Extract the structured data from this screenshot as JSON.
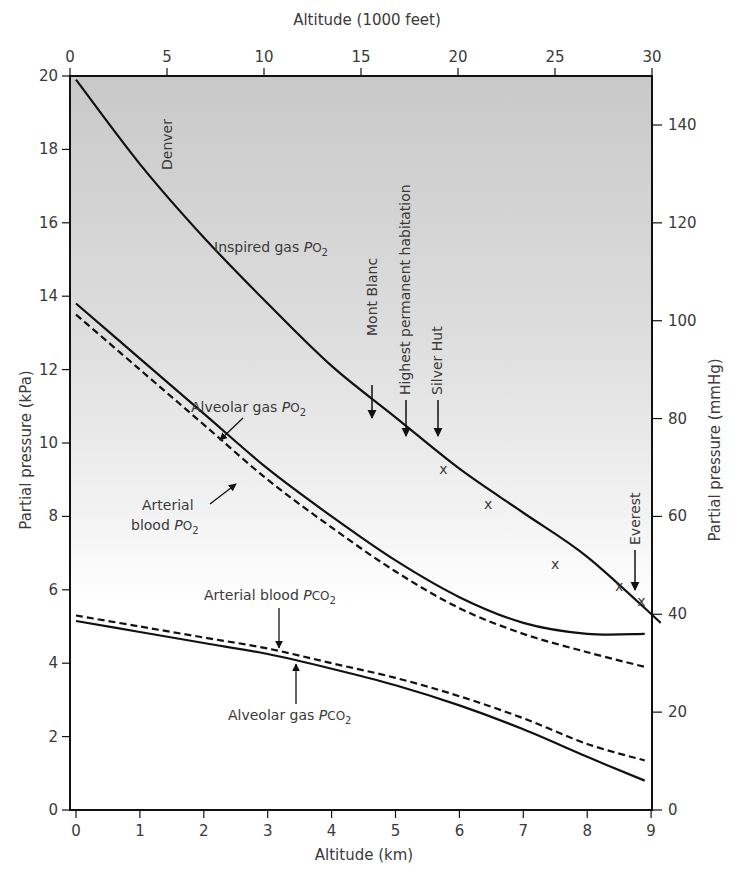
{
  "chart_data": {
    "type": "line",
    "title": "",
    "xlabel": "Altitude (km)",
    "x2label": "Altitude (1000 feet)",
    "ylabel": "Partial pressure (kPa)",
    "y2label": "Partial pressure (mmHg)",
    "xlim": [
      0,
      9.15
    ],
    "ylim": [
      0,
      20
    ],
    "x_ticks": [
      "0",
      "1",
      "2",
      "3",
      "4",
      "5",
      "6",
      "7",
      "8",
      "9"
    ],
    "x2_ticks": [
      "0",
      "5",
      "10",
      "15",
      "20",
      "25",
      "30"
    ],
    "y_ticks": [
      "0",
      "2",
      "4",
      "6",
      "8",
      "10",
      "12",
      "14",
      "16",
      "18",
      "20"
    ],
    "y2_ticks": [
      "0",
      "20",
      "40",
      "60",
      "80",
      "100",
      "120",
      "140"
    ],
    "grid": false,
    "background": "gray gradient (dark at top, fading to white near 5 kPa)",
    "series": [
      {
        "name": "Inspired gas PO2",
        "style": "solid",
        "x": [
          0,
          1,
          2,
          3,
          4,
          5,
          6,
          7,
          8,
          9.15
        ],
        "y": [
          19.9,
          17.6,
          15.6,
          13.8,
          12.1,
          10.7,
          9.3,
          8.1,
          6.9,
          5.1
        ]
      },
      {
        "name": "Alveolar gas PO2",
        "style": "solid",
        "x": [
          0,
          1,
          2,
          3,
          4,
          5,
          6,
          7,
          8,
          8.9
        ],
        "y": [
          13.8,
          12.3,
          10.8,
          9.3,
          8.0,
          6.8,
          5.8,
          5.1,
          4.8,
          4.8
        ]
      },
      {
        "name": "Arterial blood PO2",
        "style": "dashed",
        "x": [
          0,
          1,
          2,
          3,
          4,
          5,
          6,
          7,
          8,
          8.9
        ],
        "y": [
          13.5,
          12.0,
          10.5,
          9.0,
          7.7,
          6.5,
          5.5,
          4.8,
          4.3,
          3.9
        ]
      },
      {
        "name": "Arterial blood PCO2",
        "style": "dashed",
        "x": [
          0,
          1,
          2,
          3,
          4,
          5,
          6,
          7,
          8,
          8.9
        ],
        "y": [
          5.3,
          5.0,
          4.7,
          4.4,
          4.0,
          3.6,
          3.1,
          2.5,
          1.8,
          1.35
        ]
      },
      {
        "name": "Alveolar gas PCO2",
        "style": "solid",
        "x": [
          0,
          1,
          2,
          3,
          4,
          5,
          6,
          7,
          8,
          8.9
        ],
        "y": [
          5.15,
          4.85,
          4.55,
          4.25,
          3.85,
          3.4,
          2.85,
          2.2,
          1.45,
          0.8
        ]
      }
    ],
    "markers": [
      {
        "symbol": "x",
        "x": 5.75,
        "y": 9.3
      },
      {
        "symbol": "x",
        "x": 6.45,
        "y": 8.35
      },
      {
        "symbol": "x",
        "x": 7.5,
        "y": 6.7
      },
      {
        "symbol": "x",
        "x": 8.5,
        "y": 6.1
      },
      {
        "symbol": "x",
        "x": 8.85,
        "y": 5.7
      }
    ],
    "annotations": [
      {
        "text": "Denver",
        "x": 1.55,
        "y": 18.4,
        "rotation": -90
      },
      {
        "text": "Mont Blanc",
        "x": 4.7,
        "arrow_to_y": 10.7,
        "rotation": -90
      },
      {
        "text": "Highest permanent habitation",
        "x": 5.2,
        "arrow_to_y": 9.9,
        "rotation": -90
      },
      {
        "text": "Silver Hut",
        "x": 5.75,
        "arrow_to_y": 9.5,
        "rotation": -90
      },
      {
        "text": "Everest",
        "x": 8.85,
        "arrow_to_y": 5.9,
        "rotation": -90
      },
      {
        "text": "Inspired gas PO2",
        "x": 2.9,
        "y": 15.1
      },
      {
        "text": "Alveolar gas PO2",
        "x": 2.6,
        "y": 10.8
      },
      {
        "text": "Arterial blood PO2",
        "x": 1.6,
        "y": 8.2
      },
      {
        "text": "Arterial blood PCO2",
        "x": 3.2,
        "y": 5.5
      },
      {
        "text": "Alveolar gas PCO2",
        "x": 3.5,
        "y": 2.6
      }
    ]
  },
  "labels": {
    "xlabel": "Altitude (km)",
    "x2label": "Altitude (1000 feet)",
    "ylabel": "Partial pressure (kPa)",
    "y2label": "Partial pressure (mmHg)",
    "denver": "Denver",
    "mont_blanc": "Mont Blanc",
    "highest": "Highest permanent habitation",
    "silver_hut": "Silver Hut",
    "everest": "Everest",
    "inspired_main": "Inspired gas ",
    "alveolar_o2_main": "Alveolar gas ",
    "arterial_o2_line1": "Arterial",
    "arterial_o2_line2": "blood ",
    "arterial_co2_main": "Arterial blood ",
    "alveolar_co2_main": "Alveolar gas ",
    "p": "P",
    "o2": "O",
    "co2": "CO",
    "sub2": "2",
    "marker": "x"
  }
}
